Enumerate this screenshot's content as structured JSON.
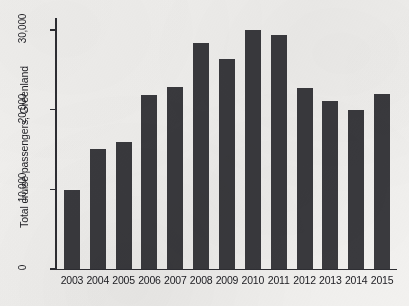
{
  "chart_data": {
    "type": "bar",
    "title": "",
    "subtitle": "",
    "xlabel": "",
    "ylabel": "Total cruise passengers, Greenland",
    "categories": [
      "2003",
      "2004",
      "2005",
      "2006",
      "2007",
      "2008",
      "2009",
      "2010",
      "2011",
      "2012",
      "2013",
      "2014",
      "2015"
    ],
    "values": [
      9900,
      15100,
      15900,
      21800,
      22900,
      28400,
      26300,
      30000,
      29400,
      22700,
      21100,
      20000,
      22000
    ],
    "ylim": [
      0,
      31500
    ],
    "xlim_note": "categorical, 13 bars",
    "y_tick_values": [
      0,
      10000,
      20000,
      30000
    ],
    "y_tick_labels": [
      "0",
      "10,000",
      "20,000",
      "30,000"
    ],
    "grid": false,
    "legend": null,
    "legend_position": "none",
    "annotations": [],
    "series": [
      {
        "name": "Total cruise passengers, Greenland",
        "values": [
          9900,
          15100,
          15900,
          21800,
          22900,
          28400,
          26300,
          30000,
          29400,
          22700,
          21100,
          20000,
          22000
        ]
      }
    ],
    "colors": {
      "bar": "#3a3a3e",
      "axis": "#2e2e33",
      "text": "#1f1f24",
      "background": "#f2f1ef"
    }
  }
}
